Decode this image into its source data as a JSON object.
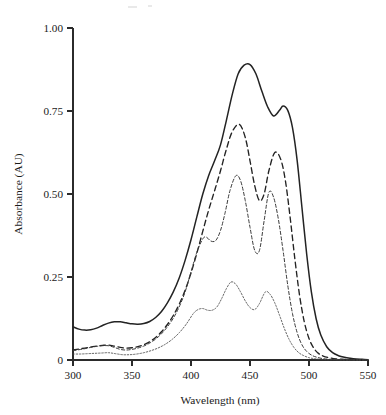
{
  "figure": {
    "background_color": "#ffffff",
    "ink_color": "#232323"
  },
  "axes": {
    "x": {
      "title": "Wavelength (nm)",
      "ticks": [
        "300",
        "350",
        "400",
        "450",
        "500",
        "550"
      ],
      "tick_values": [
        300,
        350,
        400,
        450,
        500,
        550
      ],
      "range": [
        300,
        550
      ]
    },
    "y": {
      "title": "Absorbance (AU)",
      "ticks": [
        "0",
        "0.25",
        "0.50",
        "0.75",
        "1.00"
      ],
      "tick_values": [
        0,
        0.25,
        0.5,
        0.75,
        1.0
      ],
      "range": [
        0,
        1.0
      ]
    }
  },
  "chart_data": {
    "type": "line",
    "title": "",
    "subtitle": "",
    "xlabel": "Wavelength (nm)",
    "ylabel": "Absorbance (AU)",
    "xlim": [
      300,
      550
    ],
    "ylim": [
      0,
      1.0
    ],
    "xticks": [
      300,
      350,
      400,
      450,
      500,
      550
    ],
    "yticks": [
      0,
      0.25,
      0.5,
      0.75,
      1.0
    ],
    "grid": false,
    "legend": "none",
    "annotations": [],
    "series": [
      {
        "name": "spectrum-1",
        "style": "solid",
        "color": "#232323",
        "peaks": [
          {
            "x": 338,
            "y": 0.115,
            "kind": "shoulder"
          },
          {
            "x": 450,
            "y": 0.89,
            "kind": "maximum"
          },
          {
            "x": 478,
            "y": 0.765,
            "kind": "secondary"
          }
        ],
        "x": [
          300,
          305,
          310,
          315,
          320,
          325,
          330,
          335,
          340,
          345,
          350,
          355,
          360,
          365,
          370,
          375,
          380,
          385,
          390,
          395,
          400,
          405,
          410,
          415,
          420,
          425,
          430,
          435,
          440,
          445,
          450,
          455,
          460,
          465,
          470,
          475,
          478,
          482,
          486,
          490,
          494,
          498,
          502,
          506,
          510,
          515,
          520,
          525,
          530,
          535,
          540,
          545,
          550
        ],
        "y": [
          0.1,
          0.093,
          0.09,
          0.091,
          0.096,
          0.104,
          0.111,
          0.115,
          0.115,
          0.112,
          0.109,
          0.108,
          0.11,
          0.116,
          0.128,
          0.146,
          0.172,
          0.205,
          0.247,
          0.3,
          0.362,
          0.432,
          0.5,
          0.556,
          0.6,
          0.648,
          0.722,
          0.8,
          0.862,
          0.888,
          0.89,
          0.862,
          0.81,
          0.762,
          0.735,
          0.752,
          0.765,
          0.752,
          0.7,
          0.6,
          0.46,
          0.32,
          0.205,
          0.125,
          0.075,
          0.04,
          0.022,
          0.013,
          0.008,
          0.005,
          0.003,
          0.002,
          0.001
        ]
      },
      {
        "name": "spectrum-2",
        "style": "long-dash",
        "color": "#232323",
        "peaks": [
          {
            "x": 330,
            "y": 0.045,
            "kind": "shoulder"
          },
          {
            "x": 441,
            "y": 0.71,
            "kind": "maximum"
          },
          {
            "x": 471,
            "y": 0.625,
            "kind": "secondary"
          }
        ],
        "x": [
          300,
          305,
          310,
          315,
          320,
          325,
          330,
          335,
          340,
          345,
          350,
          355,
          360,
          365,
          370,
          375,
          380,
          385,
          390,
          395,
          400,
          405,
          410,
          415,
          420,
          425,
          430,
          435,
          441,
          446,
          450,
          454,
          458,
          462,
          466,
          471,
          476,
          480,
          484,
          488,
          492,
          496,
          500,
          504,
          508,
          512,
          518,
          524,
          530,
          536,
          542,
          550
        ],
        "y": [
          0.03,
          0.033,
          0.036,
          0.039,
          0.042,
          0.044,
          0.045,
          0.042,
          0.038,
          0.036,
          0.037,
          0.04,
          0.046,
          0.055,
          0.068,
          0.085,
          0.107,
          0.134,
          0.168,
          0.21,
          0.262,
          0.322,
          0.388,
          0.452,
          0.51,
          0.57,
          0.635,
          0.688,
          0.71,
          0.67,
          0.6,
          0.525,
          0.48,
          0.5,
          0.57,
          0.625,
          0.605,
          0.54,
          0.43,
          0.305,
          0.195,
          0.115,
          0.065,
          0.036,
          0.02,
          0.012,
          0.006,
          0.003,
          0.002,
          0.001,
          0.001,
          0.0
        ]
      },
      {
        "name": "spectrum-3",
        "style": "short-dash",
        "color": "#3a3a3a",
        "peaks": [
          {
            "x": 330,
            "y": 0.043,
            "kind": "shoulder"
          },
          {
            "x": 413,
            "y": 0.37,
            "kind": "shoulder"
          },
          {
            "x": 438,
            "y": 0.555,
            "kind": "maximum"
          },
          {
            "x": 466,
            "y": 0.505,
            "kind": "secondary"
          }
        ],
        "x": [
          300,
          305,
          310,
          315,
          320,
          325,
          330,
          335,
          340,
          345,
          350,
          355,
          360,
          365,
          370,
          375,
          380,
          385,
          390,
          395,
          400,
          405,
          410,
          413,
          417,
          421,
          425,
          429,
          433,
          438,
          442,
          446,
          450,
          454,
          458,
          462,
          466,
          470,
          474,
          478,
          482,
          486,
          490,
          494,
          498,
          502,
          506,
          512,
          518,
          524,
          532,
          540,
          550
        ],
        "y": [
          0.028,
          0.031,
          0.034,
          0.038,
          0.041,
          0.043,
          0.043,
          0.038,
          0.032,
          0.03,
          0.032,
          0.036,
          0.042,
          0.051,
          0.063,
          0.079,
          0.1,
          0.126,
          0.16,
          0.205,
          0.265,
          0.325,
          0.365,
          0.37,
          0.358,
          0.36,
          0.39,
          0.445,
          0.51,
          0.555,
          0.54,
          0.48,
          0.4,
          0.33,
          0.33,
          0.42,
          0.505,
          0.49,
          0.425,
          0.33,
          0.225,
          0.14,
          0.082,
          0.046,
          0.026,
          0.015,
          0.009,
          0.004,
          0.002,
          0.001,
          0.001,
          0.0,
          0.0
        ]
      },
      {
        "name": "spectrum-4",
        "style": "dotted",
        "color": "#4a4a4a",
        "peaks": [
          {
            "x": 330,
            "y": 0.022,
            "kind": "shoulder"
          },
          {
            "x": 410,
            "y": 0.155,
            "kind": "shoulder"
          },
          {
            "x": 434,
            "y": 0.235,
            "kind": "maximum"
          },
          {
            "x": 463,
            "y": 0.205,
            "kind": "secondary"
          }
        ],
        "x": [
          300,
          306,
          312,
          318,
          324,
          330,
          336,
          342,
          348,
          354,
          360,
          366,
          372,
          378,
          384,
          390,
          396,
          402,
          406,
          410,
          414,
          418,
          422,
          426,
          430,
          434,
          438,
          442,
          446,
          450,
          454,
          458,
          463,
          467,
          471,
          475,
          479,
          483,
          487,
          491,
          495,
          500,
          505,
          510,
          516,
          522,
          530,
          540,
          550
        ],
        "y": [
          0.018,
          0.018,
          0.019,
          0.02,
          0.021,
          0.022,
          0.019,
          0.016,
          0.016,
          0.018,
          0.022,
          0.028,
          0.036,
          0.047,
          0.062,
          0.082,
          0.108,
          0.14,
          0.152,
          0.155,
          0.15,
          0.15,
          0.16,
          0.185,
          0.215,
          0.235,
          0.228,
          0.205,
          0.178,
          0.158,
          0.152,
          0.17,
          0.205,
          0.198,
          0.172,
          0.135,
          0.096,
          0.063,
          0.039,
          0.023,
          0.014,
          0.007,
          0.004,
          0.002,
          0.001,
          0.001,
          0.0,
          0.0,
          0.0
        ]
      }
    ]
  }
}
